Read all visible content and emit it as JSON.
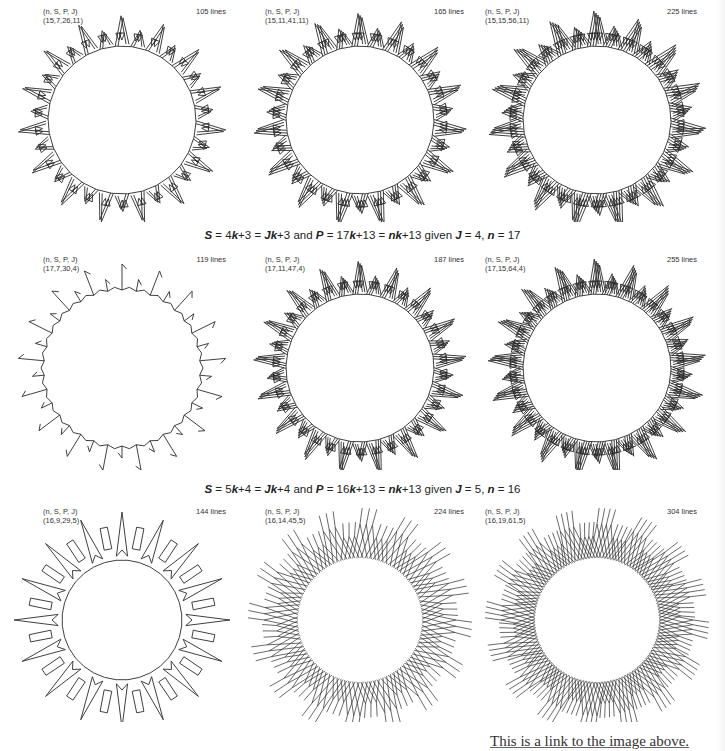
{
  "figure": {
    "param_header": "(n, S, P, J)",
    "rows": [
      {
        "panels": [
          {
            "params": "(15,7,26,11)",
            "n": 15,
            "S": 7,
            "P": 26,
            "J": 11,
            "lines_label": "105 lines",
            "style": "spike"
          },
          {
            "params": "(15,11,41,11)",
            "n": 15,
            "S": 11,
            "P": 41,
            "J": 11,
            "lines_label": "165 lines",
            "style": "spike"
          },
          {
            "params": "(15,15,56,11)",
            "n": 15,
            "S": 15,
            "P": 56,
            "J": 11,
            "lines_label": "225 lines",
            "style": "spike"
          }
        ]
      },
      {
        "caption": {
          "parts": [
            "S",
            " = 4",
            "k",
            "+3 = ",
            "Jk",
            "+3 and ",
            "P",
            " = 17",
            "k",
            "+13 = ",
            "nk",
            "+13 given ",
            "J",
            " = 4, ",
            "n",
            " = 17"
          ]
        },
        "panels": [
          {
            "params": "(17,7,30,4)",
            "n": 17,
            "S": 7,
            "P": 30,
            "J": 4,
            "lines_label": "119 lines",
            "style": "flag"
          },
          {
            "params": "(17,11,47,4)",
            "n": 17,
            "S": 11,
            "P": 47,
            "J": 4,
            "lines_label": "187 lines",
            "style": "spike"
          },
          {
            "params": "(17,15,64,4)",
            "n": 17,
            "S": 15,
            "P": 64,
            "J": 4,
            "lines_label": "255 lines",
            "style": "spike"
          }
        ]
      },
      {
        "caption": {
          "parts": [
            "S",
            " = 5",
            "k",
            "+4 = ",
            "Jk",
            "+4 and ",
            "P",
            " = 16",
            "k",
            "+13 = ",
            "nk",
            "+13 given ",
            "J",
            " = 5, ",
            "n",
            " = 16"
          ]
        },
        "panels": [
          {
            "params": "(16,9,29,5)",
            "n": 16,
            "S": 9,
            "P": 29,
            "J": 5,
            "lines_label": "144 lines",
            "style": "box"
          },
          {
            "params": "(16,14,45,5)",
            "n": 16,
            "S": 14,
            "P": 45,
            "J": 5,
            "lines_label": "224 lines",
            "style": "lattice"
          },
          {
            "params": "(16,19,61,5)",
            "n": 16,
            "S": 19,
            "P": 61,
            "J": 5,
            "lines_label": "304 lines",
            "style": "lattice"
          }
        ]
      }
    ]
  },
  "link": {
    "text": "This is a link to the image above."
  },
  "colors": {
    "stroke": "#2a2a2a",
    "background": "#ffffff",
    "text": "#333333"
  }
}
